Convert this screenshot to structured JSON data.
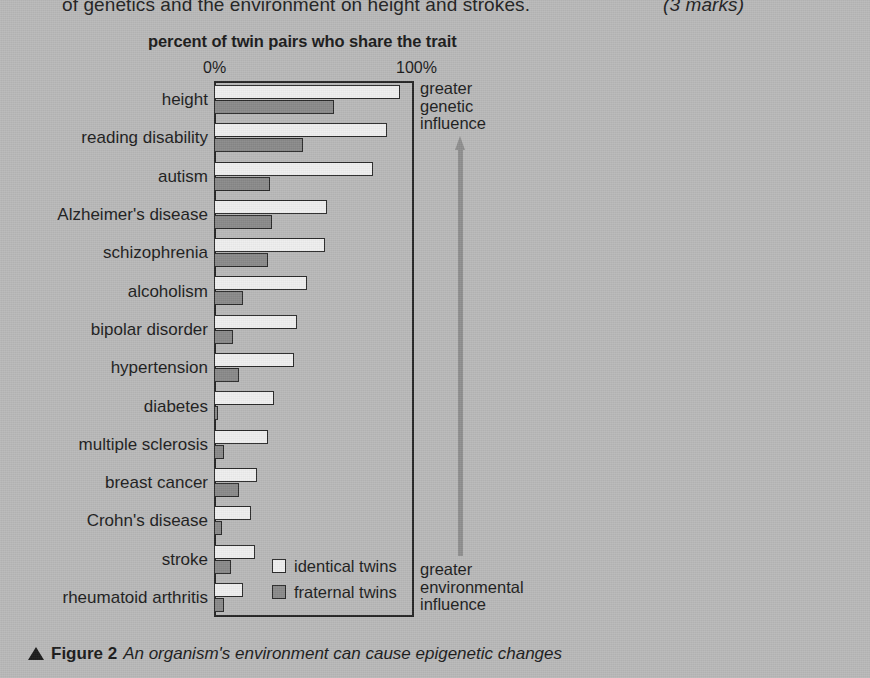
{
  "question": {
    "text": "of genetics and the environment on height and strokes.",
    "marks": "(3 marks)"
  },
  "caption": {
    "figure_label": "Figure 2",
    "text": "An organism's environment can cause epigenetic changes",
    "triangle_icon": "up-triangle-icon"
  },
  "annotations": {
    "top": "greater\ngenetic\ninfluence",
    "top_line1": "greater",
    "top_line2": "genetic",
    "top_line3": "influence",
    "bottom_line1": "greater",
    "bottom_line2": "environmental",
    "bottom_line3": "influence",
    "arrow_icon": "up-arrow-icon",
    "arrow_color": "#8f8f8f"
  },
  "legend": {
    "items": [
      {
        "label": "identical twins",
        "color": "#efefef",
        "key": "identical"
      },
      {
        "label": "fraternal twins",
        "color": "#8a8a8a",
        "key": "fraternal"
      }
    ]
  },
  "chart_data": {
    "type": "bar",
    "orientation": "horizontal",
    "title": "percent of twin pairs who share the trait",
    "xlabel": "percent of twin pairs who share the trait",
    "ylabel": "",
    "xlim": [
      0,
      100
    ],
    "tick_labels": [
      "0%",
      "100%"
    ],
    "ticks": [
      0,
      100
    ],
    "grid": false,
    "legend_position": "inside-bottom-left",
    "categories": [
      "height",
      "reading disability",
      "autism",
      "Alzheimer's disease",
      "schizophrenia",
      "alcoholism",
      "bipolar disorder",
      "hypertension",
      "diabetes",
      "multiple sclerosis",
      "breast cancer",
      "Crohn's disease",
      "stroke",
      "rheumatoid arthritis"
    ],
    "series": [
      {
        "name": "identical twins",
        "color": "#efefef",
        "values": [
          96,
          89,
          82,
          58,
          57,
          48,
          43,
          41,
          31,
          28,
          22,
          19,
          21,
          15
        ]
      },
      {
        "name": "fraternal twins",
        "color": "#8a8a8a",
        "values": [
          62,
          46,
          29,
          30,
          28,
          15,
          10,
          13,
          2,
          5,
          13,
          4,
          9,
          5
        ]
      }
    ]
  }
}
